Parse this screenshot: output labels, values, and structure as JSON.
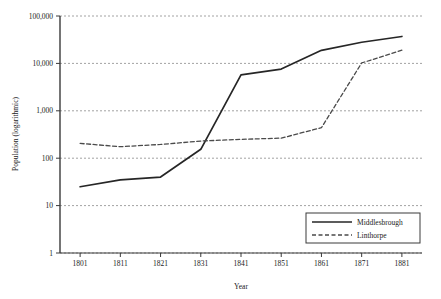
{
  "chart_data": {
    "type": "line",
    "title": "",
    "xlabel": "Year",
    "ylabel": "Population (logarithmic)",
    "yscale": "log",
    "ylim": [
      1,
      100000
    ],
    "ytick_labels": [
      "1",
      "10",
      "100",
      "1,000",
      "10,000",
      "100,000"
    ],
    "ytick_values": [
      1,
      10,
      100,
      1000,
      10000,
      100000
    ],
    "grid": true,
    "grid_style": "dotted-horizontal",
    "legend_position": "lower-right",
    "categories": [
      1801,
      1811,
      1821,
      1831,
      1841,
      1851,
      1861,
      1871,
      1881
    ],
    "xtick_labels": [
      "1801",
      "1811",
      "1821",
      "1831",
      "1841",
      "1851",
      "1861",
      "1871",
      "1881"
    ],
    "series": [
      {
        "name": "Middlesbrough",
        "style": "solid",
        "color": "#262626",
        "values": [
          25,
          35,
          40,
          154,
          5709,
          7600,
          18892,
          27900,
          37000
        ]
      },
      {
        "name": "Linthorpe",
        "style": "dashed",
        "color": "#4a4a4a",
        "values": [
          205,
          175,
          195,
          230,
          250,
          265,
          440,
          10200,
          19000
        ]
      }
    ]
  },
  "legend": {
    "entries": [
      {
        "label": "Middlesbrough",
        "style": "solid"
      },
      {
        "label": "Linthorpe",
        "style": "dashed"
      }
    ]
  },
  "colors": {
    "axis": "#3a3a3a",
    "grid": "#8a8a8a",
    "series_primary": "#262626",
    "series_secondary": "#4a4a4a",
    "legend_border": "#3a3a3a",
    "background": "#ffffff"
  }
}
